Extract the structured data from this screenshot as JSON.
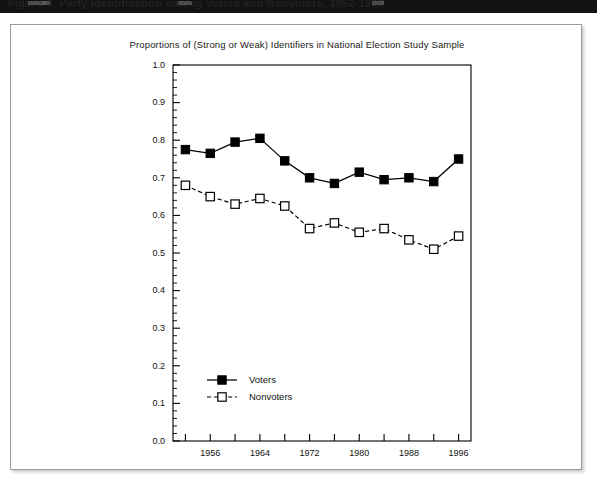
{
  "caption_bar": {
    "text": "Figure 4.  Party Identification among Voters and Nonvoters, 1952-1996"
  },
  "chart_data": {
    "type": "line",
    "title": "Proportions of (Strong or Weak) Identifiers in National Election Study Sample",
    "xlabel": "",
    "ylabel": "",
    "xlim": [
      1950,
      1998
    ],
    "ylim": [
      0.0,
      1.0
    ],
    "grid": false,
    "legend_position": "inside-bottom-left",
    "x": [
      1952,
      1956,
      1960,
      1964,
      1968,
      1972,
      1976,
      1980,
      1984,
      1988,
      1992,
      1996
    ],
    "x_tick_values": [
      1952,
      1956,
      1960,
      1964,
      1968,
      1972,
      1976,
      1980,
      1984,
      1988,
      1992,
      1996
    ],
    "x_tick_labels": [
      "",
      "1956",
      "",
      "1964",
      "",
      "1972",
      "",
      "1980",
      "",
      "1988",
      "",
      "1996"
    ],
    "y_tick_values": [
      0.0,
      0.1,
      0.2,
      0.3,
      0.4,
      0.5,
      0.6,
      0.7,
      0.8,
      0.9,
      1.0
    ],
    "y_tick_labels": [
      "0.0",
      "0.1",
      "0.2",
      "0.3",
      "0.4",
      "0.5",
      "0.6",
      "0.7",
      "0.8",
      "0.9",
      "1.0"
    ],
    "y_minor_step": 0.02,
    "series": [
      {
        "name": "Voters",
        "marker": "filled-square",
        "linestyle": "solid",
        "color": "#000000",
        "values": [
          0.775,
          0.765,
          0.795,
          0.805,
          0.745,
          0.7,
          0.685,
          0.715,
          0.695,
          0.7,
          0.69,
          0.75
        ]
      },
      {
        "name": "Nonvoters",
        "marker": "open-square",
        "linestyle": "dashed",
        "color": "#000000",
        "values": [
          0.68,
          0.65,
          0.63,
          0.645,
          0.625,
          0.565,
          0.58,
          0.555,
          0.565,
          0.535,
          0.51,
          0.545
        ]
      }
    ],
    "legend": [
      {
        "label": "Voters",
        "marker": "filled-square",
        "linestyle": "solid"
      },
      {
        "label": "Nonvoters",
        "marker": "open-square",
        "linestyle": "dashed"
      }
    ]
  }
}
